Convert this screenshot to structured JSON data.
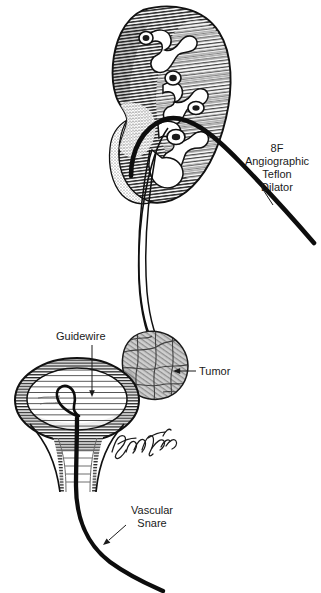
{
  "figure": {
    "background_color": "#ffffff",
    "ink_color": "#1a1a1a",
    "labels": {
      "dilator": {
        "lines": [
          "8F",
          "Angiographic",
          "Teflon",
          "Dilator"
        ],
        "line1": "8F",
        "line2": "Angiographic",
        "line3": "Teflon",
        "line4": "Dilator"
      },
      "guidewire": {
        "text": "Guidewire"
      },
      "tumor": {
        "text": "Tumor"
      },
      "snare": {
        "lines": [
          "Vascular",
          "Snare"
        ],
        "line1": "Vascular",
        "line2": "Snare"
      }
    },
    "signature": {
      "text": "Finche '85"
    },
    "anatomy": {
      "kidney": "kidney",
      "ureter": "ureter",
      "bladder": "bladder",
      "bladder_neck": "bladder-neck",
      "tumor_mass": "tumor-mass",
      "calyces": "renal-calyces"
    },
    "devices": {
      "dilator": "8f-angiographic-teflon-dilator",
      "guidewire": "guidewire",
      "snare": "vascular-snare",
      "snare_loop": "snare-loop"
    }
  }
}
